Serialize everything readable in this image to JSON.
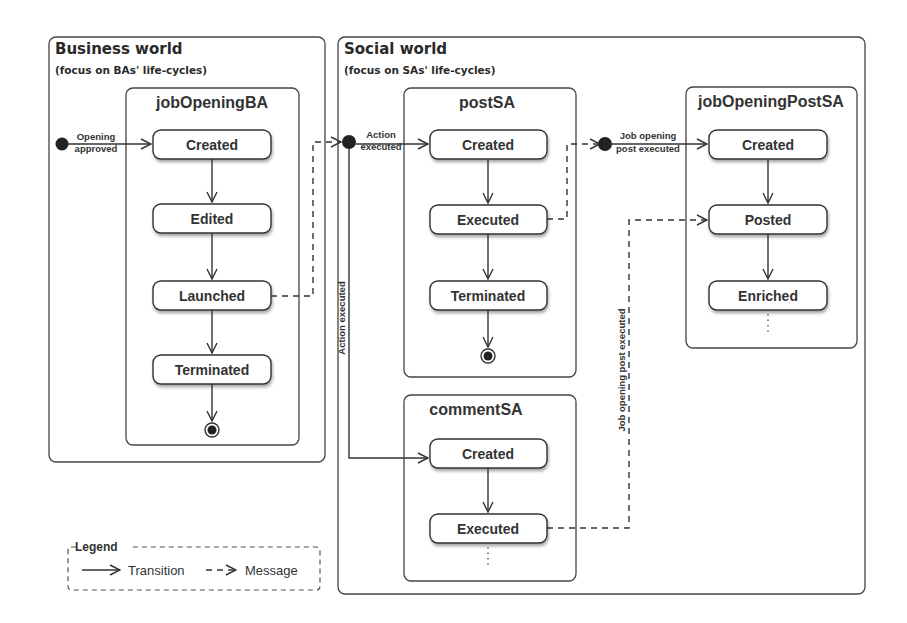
{
  "worlds": {
    "business": {
      "title": "Business world",
      "subtitle": "(focus on BAs' life-cycles)"
    },
    "social": {
      "title": "Social world",
      "subtitle": "(focus on SAs' life-cycles)"
    }
  },
  "machines": {
    "jobOpeningBA": {
      "title": "jobOpeningBA",
      "states": [
        "Created",
        "Edited",
        "Launched",
        "Terminated"
      ],
      "initial_label": [
        "Opening",
        "approved"
      ]
    },
    "postSA": {
      "title": "postSA",
      "states": [
        "Created",
        "Executed",
        "Terminated"
      ],
      "initial_label": [
        "Action",
        "executed"
      ]
    },
    "commentSA": {
      "title": "commentSA",
      "states": [
        "Created",
        "Executed"
      ],
      "vertical_label": "Action executed"
    },
    "jobOpeningPostSA": {
      "title": "jobOpeningPostSA",
      "states": [
        "Created",
        "Posted",
        "Enriched"
      ],
      "initial_label": [
        "Job opening",
        "post executed"
      ],
      "vertical_label": "Job opening post executed"
    }
  },
  "legend": {
    "title": "Legend",
    "transition": "Transition",
    "message": "Message"
  },
  "colors": {
    "stroke": "#333333",
    "background": "#ffffff",
    "fill_dot": "#222222"
  }
}
